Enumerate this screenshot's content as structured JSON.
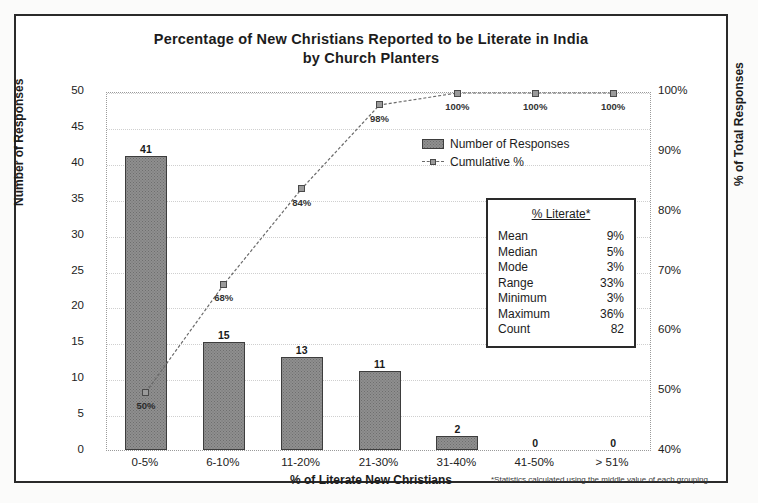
{
  "chart_data": {
    "type": "bar",
    "title": "Percentage of New Christians Reported to be Literate in India by Church Planters",
    "title_line1": "Percentage of New Christians Reported to be Literate in India",
    "title_line2": "by Church Planters",
    "xlabel": "% of Literate New Christians",
    "ylabel": "Number of Responses",
    "y2label": "% of Total Responses",
    "categories": [
      "0-5%",
      "6-10%",
      "11-20%",
      "21-30%",
      "31-40%",
      "41-50%",
      "> 51%"
    ],
    "series": [
      {
        "name": "Number of Responses",
        "type": "bar",
        "values": [
          41,
          15,
          13,
          11,
          2,
          0,
          0
        ],
        "labels": [
          "41",
          "15",
          "13",
          "11",
          "2",
          "0",
          "0"
        ]
      },
      {
        "name": "Cumulative %",
        "type": "line",
        "values": [
          50,
          68,
          84,
          98,
          100,
          100,
          100
        ],
        "labels": [
          "50%",
          "68%",
          "84%",
          "98%",
          "100%",
          "100%",
          "100%"
        ]
      }
    ],
    "ylim": [
      0,
      50
    ],
    "yticks": [
      "0",
      "5",
      "10",
      "15",
      "20",
      "25",
      "30",
      "35",
      "40",
      "45",
      "50"
    ],
    "y2lim": [
      40,
      100
    ],
    "y2ticks": [
      "40%",
      "50%",
      "60%",
      "70%",
      "80%",
      "90%",
      "100%"
    ],
    "grid": true,
    "legend_position": "upper-right",
    "colors": {
      "bar_fill": "#8f8f8f",
      "bar_border": "#3d3d3d",
      "line": "#6a6a6a",
      "text": "#1c1c1c",
      "frame": "#2a2a2a"
    }
  },
  "legend": {
    "items": [
      {
        "label": "Number of Responses",
        "marker": "bar-swatch"
      },
      {
        "label": "Cumulative %",
        "marker": "line-marker"
      }
    ]
  },
  "stats_box": {
    "title": "% Literate*",
    "rows": [
      {
        "key": "Mean",
        "value": "9%"
      },
      {
        "key": "Median",
        "value": "5%"
      },
      {
        "key": "Mode",
        "value": "3%"
      },
      {
        "key": "Range",
        "value": "33%"
      },
      {
        "key": "Minimum",
        "value": "3%"
      },
      {
        "key": "Maximum",
        "value": "36%"
      },
      {
        "key": "Count",
        "value": "82"
      }
    ]
  },
  "footnote": "*Statistics calculated using the middle value of each grouping"
}
